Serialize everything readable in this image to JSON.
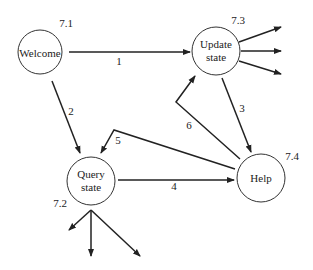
{
  "nodes": [
    {
      "id": "welcome",
      "label": "Welcome",
      "number": "7.1"
    },
    {
      "id": "update",
      "label_line1": "Update",
      "label_line2": "state",
      "number": "7.3"
    },
    {
      "id": "query",
      "label_line1": "Query",
      "label_line2": "state",
      "number": "7.2"
    },
    {
      "id": "help",
      "label": "Help",
      "number": "7.4"
    }
  ],
  "edges": [
    {
      "from": "welcome",
      "to": "update",
      "label": "1"
    },
    {
      "from": "welcome",
      "to": "query",
      "label": "2"
    },
    {
      "from": "update",
      "to": "help",
      "label": "3"
    },
    {
      "from": "query",
      "to": "help",
      "label": "4"
    },
    {
      "from": "help",
      "to": "query",
      "label": "5"
    },
    {
      "from": "help",
      "to": "update",
      "label": "6"
    }
  ],
  "colors": {
    "stroke": "#222222",
    "background": "#ffffff"
  }
}
